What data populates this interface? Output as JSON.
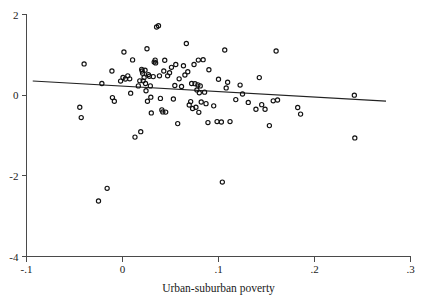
{
  "chart_data": {
    "type": "scatter",
    "title": "",
    "xlabel": "Urban-suburban poverty",
    "ylabel": "",
    "xlim": [
      -0.1,
      0.3
    ],
    "ylim": [
      -4,
      2
    ],
    "grid": false,
    "legend": "none",
    "xticks": [
      -0.1,
      0,
      0.1,
      0.2,
      0.3
    ],
    "xticklabels": [
      "-.1",
      "0",
      ".1",
      ".2",
      ".3"
    ],
    "yticks": [
      2,
      0,
      -2,
      -4
    ],
    "yticklabels": [
      "2",
      "0",
      "-2",
      "-4"
    ],
    "marker": "open-circle",
    "marker_color": "#111111",
    "fit_line": {
      "type": "linear-regression",
      "color": "#222222",
      "x_start": -0.0935,
      "y_start": 0.352,
      "x_end": 0.2745,
      "y_end": -0.148,
      "slope": -1.359,
      "intercept": 0.225
    },
    "points": [
      [
        -0.04,
        0.775
      ],
      [
        -0.0445,
        -0.3
      ],
      [
        -0.043,
        -0.555
      ],
      [
        -0.025,
        -2.625
      ],
      [
        -0.0215,
        0.29
      ],
      [
        -0.016,
        -2.31
      ],
      [
        -0.011,
        0.6
      ],
      [
        -0.0105,
        -0.06
      ],
      [
        -0.0085,
        -0.15
      ],
      [
        -0.002,
        0.35
      ],
      [
        0.0005,
        0.44
      ],
      [
        0.0015,
        1.07
      ],
      [
        0.003,
        0.4
      ],
      [
        0.0055,
        0.48
      ],
      [
        0.0075,
        0.405
      ],
      [
        0.0085,
        0.05
      ],
      [
        0.0105,
        0.875
      ],
      [
        0.013,
        -1.04
      ],
      [
        0.0165,
        0.23
      ],
      [
        0.018,
        0.355
      ],
      [
        0.019,
        -0.905
      ],
      [
        0.02,
        0.64
      ],
      [
        0.0205,
        0.6
      ],
      [
        0.021,
        0.545
      ],
      [
        0.0215,
        0.355
      ],
      [
        0.0225,
        0.44
      ],
      [
        0.0235,
        0.62
      ],
      [
        0.024,
        0.29
      ],
      [
        0.0245,
        0.11
      ],
      [
        0.0255,
        1.15
      ],
      [
        0.026,
        -0.15
      ],
      [
        0.027,
        0.51
      ],
      [
        0.028,
        0.47
      ],
      [
        0.029,
        0.23
      ],
      [
        0.0295,
        -0.05
      ],
      [
        0.03,
        -0.44
      ],
      [
        0.032,
        0.46
      ],
      [
        0.033,
        0.82
      ],
      [
        0.034,
        0.87
      ],
      [
        0.0345,
        0.8
      ],
      [
        0.0355,
        1.69
      ],
      [
        0.0375,
        1.72
      ],
      [
        0.0385,
        0.48
      ],
      [
        0.0395,
        -0.08
      ],
      [
        0.041,
        -0.365
      ],
      [
        0.042,
        -0.415
      ],
      [
        0.043,
        0.6
      ],
      [
        0.044,
        0.865
      ],
      [
        0.045,
        -0.42
      ],
      [
        0.047,
        0.48
      ],
      [
        0.049,
        0.555
      ],
      [
        0.051,
        0.69
      ],
      [
        0.053,
        -0.095
      ],
      [
        0.0545,
        0.24
      ],
      [
        0.0555,
        0.76
      ],
      [
        0.0575,
        -0.705
      ],
      [
        0.059,
        0.405
      ],
      [
        0.0615,
        0.215
      ],
      [
        0.0635,
        0.73
      ],
      [
        0.065,
        0.5
      ],
      [
        0.0665,
        1.28
      ],
      [
        0.068,
        0.58
      ],
      [
        0.0695,
        -0.245
      ],
      [
        0.071,
        -0.16
      ],
      [
        0.072,
        0.29
      ],
      [
        0.073,
        -0.33
      ],
      [
        0.0745,
        0.76
      ],
      [
        0.0755,
        0.285
      ],
      [
        0.0765,
        -0.3
      ],
      [
        0.0775,
        0.13
      ],
      [
        0.0785,
        0.255
      ],
      [
        0.079,
        0.87
      ],
      [
        0.0795,
        -0.425
      ],
      [
        0.08,
        0.06
      ],
      [
        0.081,
        0.23
      ],
      [
        0.082,
        -0.17
      ],
      [
        0.084,
        0.88
      ],
      [
        0.0855,
        0.075
      ],
      [
        0.087,
        -0.21
      ],
      [
        0.089,
        -0.68
      ],
      [
        0.09,
        0.63
      ],
      [
        0.095,
        -0.265
      ],
      [
        0.0985,
        -0.655
      ],
      [
        0.1,
        0.395
      ],
      [
        0.103,
        -0.665
      ],
      [
        0.104,
        -2.155
      ],
      [
        0.1065,
        1.12
      ],
      [
        0.108,
        0.18
      ],
      [
        0.1095,
        0.32
      ],
      [
        0.112,
        -0.655
      ],
      [
        0.118,
        -0.11
      ],
      [
        0.1225,
        0.25
      ],
      [
        0.125,
        0.03
      ],
      [
        0.131,
        -0.18
      ],
      [
        0.139,
        -0.35
      ],
      [
        0.1425,
        0.435
      ],
      [
        0.145,
        -0.235
      ],
      [
        0.1485,
        -0.35
      ],
      [
        0.153,
        -0.755
      ],
      [
        0.157,
        -0.14
      ],
      [
        0.16,
        1.095
      ],
      [
        0.1615,
        -0.12
      ],
      [
        0.1825,
        -0.305
      ],
      [
        0.1855,
        -0.47
      ],
      [
        0.2415,
        0.0
      ],
      [
        0.242,
        -1.06
      ]
    ],
    "n_points": 106
  },
  "axes": {
    "frame_color": "#4a4a4a",
    "background": "#ffffff"
  }
}
